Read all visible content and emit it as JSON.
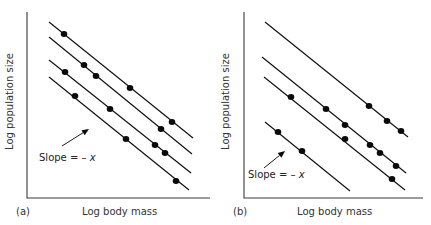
{
  "panels": [
    {
      "id": "a",
      "panel_label": "(a)",
      "xlabel": "Log body mass",
      "ylabel": "Log population size",
      "annotation": {
        "prefix": "Slope = – ",
        "variable": "x"
      }
    },
    {
      "id": "b",
      "panel_label": "(b)",
      "xlabel": "Log body mass",
      "ylabel": "Log population size",
      "annotation": {
        "prefix": "Slope = – ",
        "variable": "x"
      }
    }
  ],
  "colors": {
    "line": "#111111",
    "dot": "#0a0a0a",
    "axis": "#3a3a3a",
    "text": "#333333"
  },
  "chart_data": [
    {
      "type": "scatter",
      "title": "(a)",
      "xlabel": "Log body mass",
      "ylabel": "Log population size",
      "grid": false,
      "units": "relative (0-100 of axis span), no tick labels shown",
      "annotation": "Slope = – x (arrow pointing at a fitted line)",
      "series": [
        {
          "name": "line 1",
          "line": [
            [
              12,
              95
            ],
            [
              90,
              32
            ]
          ],
          "points": [
            [
              20,
              88
            ],
            [
              56,
              59
            ],
            [
              79,
              41
            ]
          ]
        },
        {
          "name": "line 2",
          "line": [
            [
              12,
              87
            ],
            [
              90,
              24
            ]
          ],
          "points": [
            [
              31,
              72
            ],
            [
              38,
              66
            ],
            [
              73,
              37
            ]
          ]
        },
        {
          "name": "line 3",
          "line": [
            [
              12,
              74
            ],
            [
              89,
              13
            ]
          ],
          "points": [
            [
              21,
              68
            ],
            [
              45,
              48
            ],
            [
              70,
              28
            ],
            [
              75,
              24
            ]
          ]
        },
        {
          "name": "line 4",
          "line": [
            [
              12,
              65
            ],
            [
              88,
              4
            ]
          ],
          "points": [
            [
              26,
              55
            ],
            [
              54,
              32
            ],
            [
              81,
              9
            ]
          ]
        }
      ]
    },
    {
      "type": "scatter",
      "title": "(b)",
      "xlabel": "Log body mass",
      "ylabel": "Log population size",
      "grid": false,
      "units": "relative (0-100 of axis span), no tick labels shown",
      "annotation": "Slope = – x (arrow pointing at a fitted line)",
      "series": [
        {
          "name": "line 1",
          "line": [
            [
              12,
              95
            ],
            [
              91,
              33
            ]
          ],
          "points": [
            [
              70,
              49
            ],
            [
              80,
              41
            ],
            [
              88,
              36
            ]
          ]
        },
        {
          "name": "line 2",
          "line": [
            [
              10,
              76
            ],
            [
              91,
              13
            ]
          ],
          "points": [
            [
              46,
              48
            ],
            [
              56,
              39
            ],
            [
              70,
              28
            ],
            [
              76,
              24
            ],
            [
              85,
              17
            ]
          ]
        },
        {
          "name": "line 3",
          "line": [
            [
              11,
              65
            ],
            [
              90,
              4
            ]
          ],
          "points": [
            [
              26,
              54
            ],
            [
              56,
              32
            ],
            [
              83,
              10
            ]
          ]
        },
        {
          "name": "line 4",
          "line": [
            [
              12,
              41
            ],
            [
              59,
              4
            ]
          ],
          "points": [
            [
              19,
              35
            ],
            [
              32,
              25
            ]
          ]
        }
      ]
    }
  ],
  "geometry": {
    "panels": [
      {
        "axis": {
          "x0": 27,
          "y0": 198,
          "ytop": 12,
          "xright": 210
        },
        "lines": [
          [
            49,
            22,
            193,
            138
          ],
          [
            49,
            37,
            192,
            154
          ],
          [
            49,
            60,
            191,
            173
          ],
          [
            49,
            77,
            189,
            190
          ]
        ],
        "dots": [
          [
            64,
            34
          ],
          [
            130,
            88
          ],
          [
            172,
            122
          ],
          [
            84,
            65
          ],
          [
            96,
            76
          ],
          [
            161,
            129
          ],
          [
            65,
            72
          ],
          [
            110,
            109
          ],
          [
            155,
            145
          ],
          [
            165,
            153
          ],
          [
            75,
            96
          ],
          [
            126,
            139
          ],
          [
            176,
            181
          ]
        ],
        "arrow": [
          62,
          146,
          89,
          129
        ]
      },
      {
        "axis": {
          "x0": 244,
          "y0": 198,
          "ytop": 12,
          "xright": 423
        },
        "lines": [
          [
            265,
            22,
            408,
            137
          ],
          [
            262,
            57,
            406,
            173
          ],
          [
            264,
            77,
            405,
            190
          ],
          [
            265,
            122,
            350,
            191
          ]
        ],
        "dots": [
          [
            369,
            106
          ],
          [
            387,
            121
          ],
          [
            401,
            131
          ],
          [
            326,
            109
          ],
          [
            345,
            125
          ],
          [
            370,
            145
          ],
          [
            380,
            153
          ],
          [
            396,
            166
          ],
          [
            291,
            97
          ],
          [
            345,
            139
          ],
          [
            392,
            179
          ],
          [
            278,
            132
          ],
          [
            302,
            151
          ]
        ],
        "arrow": [
          264,
          168,
          285,
          151
        ]
      }
    ]
  }
}
